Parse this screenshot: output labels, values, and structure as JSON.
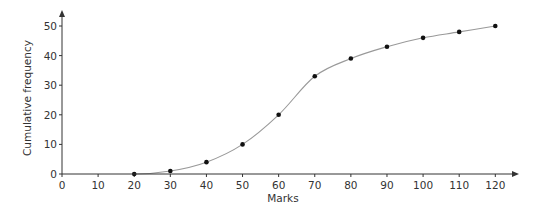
{
  "chart_data": {
    "type": "line",
    "title": "",
    "xlabel": "Marks",
    "ylabel": "Cumulative frequency",
    "xlim": [
      0,
      120
    ],
    "ylim": [
      0,
      50
    ],
    "x_ticks": [
      0,
      10,
      20,
      30,
      40,
      50,
      60,
      70,
      80,
      90,
      100,
      110,
      120
    ],
    "y_ticks": [
      0,
      10,
      20,
      30,
      40,
      50
    ],
    "grid": false,
    "legend": null,
    "series": [
      {
        "name": "Cumulative frequency",
        "x": [
          20,
          30,
          40,
          50,
          60,
          70,
          80,
          90,
          100,
          110,
          120
        ],
        "values": [
          0,
          1,
          4,
          10,
          20,
          33,
          39,
          43,
          46,
          48,
          50
        ],
        "marker": "dot",
        "smooth": true
      }
    ]
  },
  "colors": {
    "axis": "#333333",
    "curve": "#999999",
    "marker": "#111111"
  }
}
